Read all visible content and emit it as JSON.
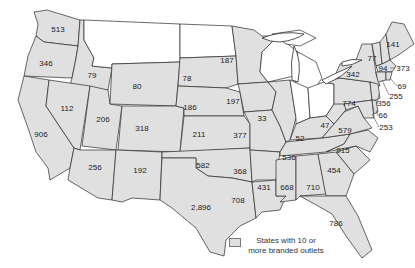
{
  "map": {
    "type": "choropleth",
    "region": "Continental United States",
    "shaded_color": "#e0e0e0",
    "unshaded_color": "#ffffff",
    "states": [
      {
        "state": "Washington",
        "abbr": "WA",
        "value": "513",
        "shaded": true
      },
      {
        "state": "Oregon",
        "abbr": "OR",
        "value": "346",
        "shaded": true
      },
      {
        "state": "California",
        "abbr": "CA",
        "value": "906",
        "shaded": true
      },
      {
        "state": "Idaho",
        "abbr": "ID",
        "value": "79",
        "shaded": true
      },
      {
        "state": "Nevada",
        "abbr": "NV",
        "value": "112",
        "shaded": true
      },
      {
        "state": "Utah",
        "abbr": "UT",
        "value": "206",
        "shaded": true
      },
      {
        "state": "Arizona",
        "abbr": "AZ",
        "value": "256",
        "shaded": true
      },
      {
        "state": "Wyoming",
        "abbr": "WY",
        "value": "80",
        "shaded": true
      },
      {
        "state": "Colorado",
        "abbr": "CO",
        "value": "318",
        "shaded": true
      },
      {
        "state": "New Mexico",
        "abbr": "NM",
        "value": "192",
        "shaded": true
      },
      {
        "state": "South Dakota",
        "abbr": "SD",
        "value": "78",
        "shaded": true
      },
      {
        "state": "Nebraska",
        "abbr": "NE",
        "value": "186",
        "shaded": true
      },
      {
        "state": "Kansas",
        "abbr": "KS",
        "value": "211",
        "shaded": true
      },
      {
        "state": "Oklahoma",
        "abbr": "OK",
        "value": "582",
        "shaded": true
      },
      {
        "state": "Texas",
        "abbr": "TX",
        "value": "2,896",
        "shaded": true
      },
      {
        "state": "Minnesota",
        "abbr": "MN",
        "value": "187",
        "shaded": true
      },
      {
        "state": "Iowa",
        "abbr": "IA",
        "value": "197",
        "shaded": true
      },
      {
        "state": "Missouri",
        "abbr": "MO",
        "value": "377",
        "shaded": true
      },
      {
        "state": "Arkansas",
        "abbr": "AR",
        "value": "368",
        "shaded": true
      },
      {
        "state": "Louisiana",
        "abbr": "LA",
        "value": "708",
        "shaded": true
      },
      {
        "state": "Illinois",
        "abbr": "IL",
        "value": "33",
        "shaded": true
      },
      {
        "state": "Kentucky",
        "abbr": "KY",
        "value": "52",
        "shaded": true
      },
      {
        "state": "Tennessee",
        "abbr": "TN",
        "value": "536",
        "shaded": true
      },
      {
        "state": "Mississippi",
        "abbr": "MS",
        "value": "431",
        "shaded": true
      },
      {
        "state": "Alabama",
        "abbr": "AL",
        "value": "668",
        "shaded": true
      },
      {
        "state": "Georgia",
        "abbr": "GA",
        "value": "710",
        "shaded": true
      },
      {
        "state": "Florida",
        "abbr": "FL",
        "value": "786",
        "shaded": true
      },
      {
        "state": "South Carolina",
        "abbr": "SC",
        "value": "454",
        "shaded": true
      },
      {
        "state": "North Carolina",
        "abbr": "NC",
        "value": "915",
        "shaded": true
      },
      {
        "state": "Virginia",
        "abbr": "VA",
        "value": "579",
        "shaded": true
      },
      {
        "state": "West Virginia",
        "abbr": "WV",
        "value": "47",
        "shaded": true
      },
      {
        "state": "Pennsylvania",
        "abbr": "PA",
        "value": "774",
        "shaded": true
      },
      {
        "state": "New York",
        "abbr": "NY",
        "value": "342",
        "shaded": true
      },
      {
        "state": "Vermont",
        "abbr": "VT",
        "value": "77",
        "shaded": true
      },
      {
        "state": "New Hampshire",
        "abbr": "NH",
        "value": "94",
        "shaded": true
      },
      {
        "state": "Maine",
        "abbr": "ME",
        "value": "141",
        "shaded": true
      },
      {
        "state": "Massachusetts",
        "abbr": "MA",
        "value": "373",
        "shaded": true
      },
      {
        "state": "Rhode Island",
        "abbr": "RI",
        "value": "69",
        "shaded": true
      },
      {
        "state": "Connecticut",
        "abbr": "CT",
        "value": "255",
        "shaded": true
      },
      {
        "state": "New Jersey",
        "abbr": "NJ",
        "value": "356",
        "shaded": true
      },
      {
        "state": "Delaware",
        "abbr": "DE",
        "value": "66",
        "shaded": true
      },
      {
        "state": "Maryland",
        "abbr": "MD",
        "value": "253",
        "shaded": true
      },
      {
        "state": "Montana",
        "abbr": "MT",
        "value": "",
        "shaded": false
      },
      {
        "state": "North Dakota",
        "abbr": "ND",
        "value": "",
        "shaded": false
      },
      {
        "state": "Wisconsin",
        "abbr": "WI",
        "value": "",
        "shaded": false
      },
      {
        "state": "Michigan",
        "abbr": "MI",
        "value": "",
        "shaded": false
      },
      {
        "state": "Indiana",
        "abbr": "IN",
        "value": "",
        "shaded": false
      },
      {
        "state": "Ohio",
        "abbr": "OH",
        "value": "",
        "shaded": false
      }
    ]
  },
  "labels": {
    "WA": "513",
    "OR": "346",
    "CA": "906",
    "ID": "79",
    "NV": "112",
    "UT": "206",
    "AZ": "256",
    "WY": "80",
    "CO": "318",
    "NM": "192",
    "SD": "78",
    "NE": "186",
    "KS": "211",
    "OK": "582",
    "TX": "2,896",
    "MN": "187",
    "IA": "197",
    "MO": "377",
    "AR": "368",
    "LA": "708",
    "IL": "33",
    "KY": "52",
    "TN": "536",
    "MS": "431",
    "AL": "668",
    "GA": "710",
    "FL": "786",
    "SC": "454",
    "NC": "915",
    "VA": "579",
    "WV": "47",
    "PA": "774",
    "NY": "342",
    "VT": "77",
    "NH": "94",
    "ME": "141",
    "MA": "373",
    "RI": "69",
    "CT": "255",
    "NJ": "356",
    "DE": "66",
    "MD": "253"
  },
  "legend": {
    "label": "States with 10 or more branded outlets"
  }
}
